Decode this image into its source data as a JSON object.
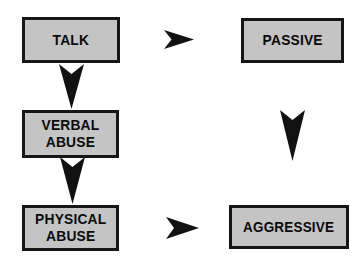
{
  "diagram": {
    "type": "flow-diagram",
    "canvas": {
      "width": 364,
      "height": 265,
      "background": "#ffffff"
    },
    "style": {
      "box_fill": "#c4c4c4",
      "box_border": "#161616",
      "text_color": "#0b0b0b",
      "arrow_color": "#111111"
    },
    "nodes": [
      {
        "id": "talk",
        "label": "TALK",
        "column": "left",
        "row": 1,
        "x": 22,
        "y": 17,
        "width": 98,
        "height": 46
      },
      {
        "id": "passive",
        "label": "PASSIVE",
        "column": "right",
        "row": 1,
        "x": 241,
        "y": 18,
        "width": 103,
        "height": 45
      },
      {
        "id": "verbal-abuse",
        "label": "VERBAL\nABUSE",
        "column": "left",
        "row": 2,
        "x": 22,
        "y": 110,
        "width": 97,
        "height": 48
      },
      {
        "id": "physical-abuse",
        "label": "PHYSICAL\nABUSE",
        "column": "left",
        "row": 3,
        "x": 22,
        "y": 205,
        "width": 97,
        "height": 46
      },
      {
        "id": "aggressive",
        "label": "AGGRESSIVE",
        "column": "right",
        "row": 3,
        "x": 229,
        "y": 205,
        "width": 120,
        "height": 44
      }
    ],
    "arrows": [
      {
        "id": "talk-to-passive",
        "direction": "right",
        "from": "talk",
        "to": "passive",
        "x": 164,
        "y": 30,
        "width": 30,
        "height": 19
      },
      {
        "id": "talk-to-verbal-abuse",
        "direction": "down",
        "from": "talk",
        "to": "verbal-abuse",
        "x": 59,
        "y": 64,
        "width": 25,
        "height": 45
      },
      {
        "id": "passive-to-aggressive",
        "direction": "down",
        "from": "passive",
        "to": "aggressive",
        "x": 280,
        "y": 110,
        "width": 25,
        "height": 51
      },
      {
        "id": "verbal-abuse-to-physical-abuse",
        "direction": "down",
        "from": "verbal-abuse",
        "to": "physical-abuse",
        "x": 60,
        "y": 157,
        "width": 25,
        "height": 47
      },
      {
        "id": "physical-abuse-to-aggressive",
        "direction": "right",
        "from": "physical-abuse",
        "to": "aggressive",
        "x": 166,
        "y": 217,
        "width": 33,
        "height": 22
      }
    ]
  }
}
